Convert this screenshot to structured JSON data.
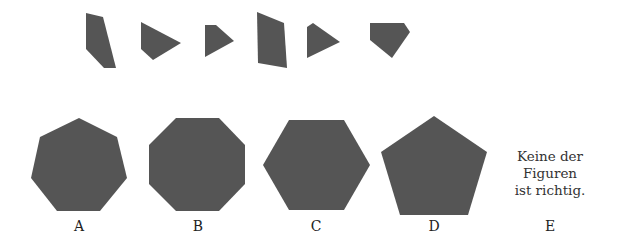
{
  "puzzle": {
    "fill_color": "#555555",
    "pieces": [
      {
        "id": "piece-1",
        "points": "86,13 103,17 116,68 104,68 86,49"
      },
      {
        "id": "piece-2",
        "points": "141,22 181,43 153,60 141,49"
      },
      {
        "id": "piece-3",
        "points": "205,25 216,25 234,41 205,57"
      },
      {
        "id": "piece-4",
        "points": "257,12 284,23 287,68 258,63"
      },
      {
        "id": "piece-5",
        "points": "307,27 313,23 340,42 307,58"
      },
      {
        "id": "piece-6",
        "points": "370,23 404,23 410,32 392,58 370,40"
      }
    ],
    "options": [
      {
        "letter": "A",
        "shape": "heptagon",
        "points": "79,118 117,137 127,178 100,211 57,211 31,178 40,137",
        "label_x": 79
      },
      {
        "letter": "B",
        "shape": "octagon",
        "points": "176,118 219,118 245,145 245,184 219,211 176,211 149,184 149,145",
        "label_x": 198
      },
      {
        "letter": "C",
        "shape": "hexagon",
        "points": "289,120 344,120 370,165 344,210 289,210 263,165",
        "label_x": 316
      },
      {
        "letter": "D",
        "shape": "pentagon",
        "points": "434,116 487,152 468,215 400,215 381,152",
        "label_x": 434
      },
      {
        "letter": "E",
        "shape": "none",
        "label_x": 550
      }
    ],
    "none_text": [
      "Keine der",
      "Figuren",
      "ist richtig."
    ]
  }
}
